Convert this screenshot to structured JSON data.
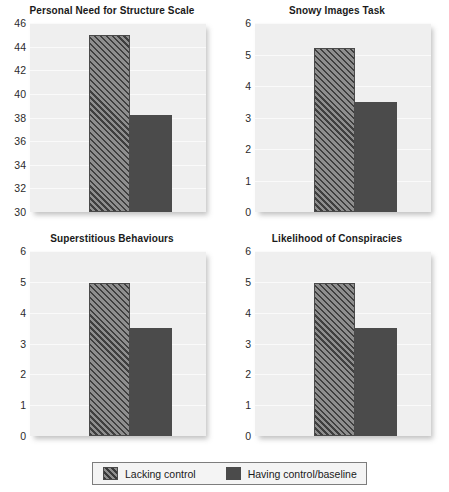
{
  "chart_data": {
    "type": "bar",
    "title": "",
    "layout": "2x2 small multiples",
    "grid": true,
    "legend_position": "bottom-center",
    "categories": [
      "Lacking control",
      "Having control/baseline"
    ],
    "series": [
      {
        "name": "Lacking control",
        "pattern": "hatched"
      },
      {
        "name": "Having control/baseline",
        "pattern": "solid"
      }
    ],
    "panels": [
      {
        "title": "Personal Need for Structure Scale",
        "ylabel": "",
        "xlabel": "",
        "ylim": [
          30,
          46
        ],
        "yticks": [
          30,
          32,
          34,
          36,
          38,
          40,
          42,
          44,
          46
        ],
        "ytick_labels": [
          "30",
          "32",
          "34",
          "36",
          "38",
          "40",
          "42",
          "44",
          "46"
        ],
        "values": [
          45.0,
          38.2
        ]
      },
      {
        "title": "Snowy Images Task",
        "ylabel": "",
        "xlabel": "",
        "ylim": [
          0,
          6
        ],
        "yticks": [
          0,
          1,
          2,
          3,
          4,
          5,
          6
        ],
        "ytick_labels": [
          "0",
          "1",
          "2",
          "3",
          "4",
          "5",
          "6"
        ],
        "values": [
          5.2,
          3.5
        ]
      },
      {
        "title": "Superstitious Behaviours",
        "ylabel": "",
        "xlabel": "",
        "ylim": [
          0,
          6
        ],
        "yticks": [
          0,
          1,
          2,
          3,
          4,
          5,
          6
        ],
        "ytick_labels": [
          "0",
          "1",
          "2",
          "3",
          "4",
          "5",
          "6"
        ],
        "values": [
          4.95,
          3.5
        ]
      },
      {
        "title": "Likelihood of Conspiracies",
        "ylabel": "",
        "xlabel": "",
        "ylim": [
          0,
          6
        ],
        "yticks": [
          0,
          1,
          2,
          3,
          4,
          5,
          6
        ],
        "ytick_labels": [
          "0",
          "1",
          "2",
          "3",
          "4",
          "5",
          "6"
        ],
        "values": [
          4.95,
          3.5
        ]
      }
    ],
    "colors": {
      "hatched_fill": "#8e8e8e",
      "hatched_line": "#3f3f3f",
      "solid_fill": "#4b4b4b",
      "plot_background": "#efefef",
      "gridline": "#fafafa",
      "text": "#1a1a1a"
    }
  },
  "legend": {
    "items": [
      {
        "label": "Lacking control",
        "swatch": "hatched-swatch"
      },
      {
        "label": "Having control/baseline",
        "swatch": "solid-swatch"
      }
    ]
  }
}
